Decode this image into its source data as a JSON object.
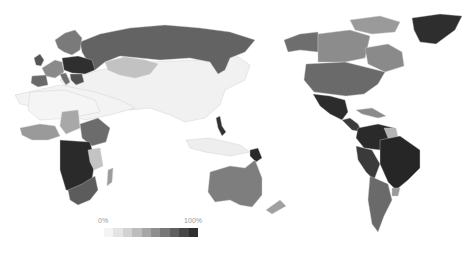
{
  "legend": {
    "min_label": "0%",
    "max_label": "100%",
    "steps": [
      "#f4f4f4",
      "#e4e4e4",
      "#d2d2d2",
      "#bdbdbd",
      "#a6a6a6",
      "#8e8e8e",
      "#777777",
      "#5f5f5f",
      "#474747",
      "#2f2f2f"
    ]
  },
  "regions": [
    {
      "name": "russia",
      "shade": "#636363"
    },
    {
      "name": "kazakhstan",
      "shade": "#c2c2c2"
    },
    {
      "name": "china-asia",
      "shade": "#f1f1f1"
    },
    {
      "name": "middle-east",
      "shade": "#f3f3f3"
    },
    {
      "name": "scandinavia",
      "shade": "#7a7a7a"
    },
    {
      "name": "western-europe",
      "shade": "#8a8a8a"
    },
    {
      "name": "iberia",
      "shade": "#6a6a6a"
    },
    {
      "name": "uk",
      "shade": "#555555"
    },
    {
      "name": "central-europe",
      "shade": "#2f2f2f"
    },
    {
      "name": "italy",
      "shade": "#6f6f6f"
    },
    {
      "name": "balkans",
      "shade": "#505050"
    },
    {
      "name": "north-africa",
      "shade": "#f5f5f5"
    },
    {
      "name": "west-africa",
      "shade": "#9a9a9a"
    },
    {
      "name": "sahel",
      "shade": "#a8a8a8"
    },
    {
      "name": "east-africa",
      "shade": "#6c6c6c"
    },
    {
      "name": "central-africa",
      "shade": "#2a2a2a"
    },
    {
      "name": "tanzania",
      "shade": "#c4c4c4"
    },
    {
      "name": "southern-africa",
      "shade": "#5c5c5c"
    },
    {
      "name": "madagascar",
      "shade": "#9c9c9c"
    },
    {
      "name": "philippines",
      "shade": "#333333"
    },
    {
      "name": "indonesia",
      "shade": "#eeeeee"
    },
    {
      "name": "papua-new-guinea",
      "shade": "#2a2a2a"
    },
    {
      "name": "australia",
      "shade": "#7e7e7e"
    },
    {
      "name": "new-zealand",
      "shade": "#a0a0a0"
    },
    {
      "name": "alaska",
      "shade": "#6e6e6e"
    },
    {
      "name": "canada",
      "shade": "#8c8c8c"
    },
    {
      "name": "canada-east",
      "shade": "#8a8a8a"
    },
    {
      "name": "arctic-islands",
      "shade": "#9a9a9a"
    },
    {
      "name": "greenland",
      "shade": "#2e2e2e"
    },
    {
      "name": "usa",
      "shade": "#6a6a6a"
    },
    {
      "name": "mexico",
      "shade": "#2c2c2c"
    },
    {
      "name": "central-america",
      "shade": "#3c3c3c"
    },
    {
      "name": "caribbean",
      "shade": "#8a8a8a"
    },
    {
      "name": "northern-south-america",
      "shade": "#2a2a2a"
    },
    {
      "name": "guianas",
      "shade": "#b4b4b4"
    },
    {
      "name": "brazil",
      "shade": "#262626"
    },
    {
      "name": "andes",
      "shade": "#3a3a3a"
    },
    {
      "name": "argentina-chile",
      "shade": "#6a6a6a"
    },
    {
      "name": "uruguay",
      "shade": "#9a9a9a"
    }
  ]
}
